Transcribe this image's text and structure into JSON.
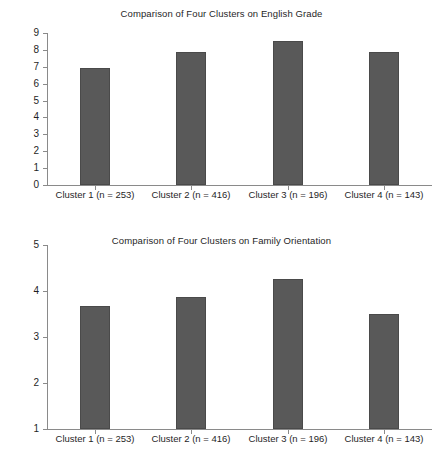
{
  "figure": {
    "background_color": "#ffffff",
    "bar_color": "#595959",
    "axis_color": "#8a8a8a",
    "text_color": "#1f1f1f"
  },
  "chart_data": [
    {
      "type": "bar",
      "title": "Comparison of Four Clusters on English Grade",
      "xlabel": "",
      "ylabel": "",
      "categories": [
        "Cluster 1 (n = 253)",
        "Cluster 2 (n = 416)",
        "Cluster 3 (n = 196)",
        "Cluster 4 (n = 143)"
      ],
      "values": [
        6.9,
        7.9,
        8.5,
        7.85
      ],
      "ylim": [
        0,
        9
      ],
      "yticks": [
        0,
        1,
        2,
        3,
        4,
        5,
        6,
        7,
        8,
        9
      ],
      "ytick_labels": [
        "0",
        "1",
        "2",
        "3",
        "4",
        "5",
        "6",
        "7",
        "8",
        "9"
      ],
      "grid": false,
      "legend": null
    },
    {
      "type": "bar",
      "title": "Comparison of Four Clusters on Family Orientation",
      "xlabel": "",
      "ylabel": "",
      "categories": [
        "Cluster 1 (n = 253)",
        "Cluster 2 (n = 416)",
        "Cluster 3 (n = 196)",
        "Cluster 4 (n = 143)"
      ],
      "values": [
        3.67,
        3.88,
        4.27,
        3.51
      ],
      "ylim": [
        1,
        5
      ],
      "yticks": [
        1,
        2,
        3,
        4,
        5
      ],
      "ytick_labels": [
        "1",
        "2",
        "3",
        "4",
        "5"
      ],
      "grid": false,
      "legend": null
    }
  ]
}
